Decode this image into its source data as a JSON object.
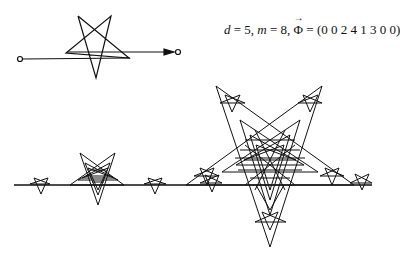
{
  "figure": {
    "caption": {
      "d_label": "d",
      "d_value": "5",
      "m_label": "m",
      "m_value": "8",
      "phi_symbol": "Φ",
      "phi_arrow": "→",
      "phi_vector": "(0 0 2 4 1 3 0 0)",
      "sep1": " = ",
      "comma": ", "
    },
    "generator": {
      "description": "pentagram generator with start and end node circles and arrow",
      "start_node": [
        20,
        59
      ],
      "end_node": [
        178,
        52
      ]
    },
    "fractal": {
      "description": "self-similar pentagram fractal curve along a horizontal baseline",
      "baseline_y": 185,
      "baseline_x_range": [
        14,
        372
      ]
    },
    "colors": {
      "stroke": "#111111",
      "background": "#ffffff"
    }
  }
}
